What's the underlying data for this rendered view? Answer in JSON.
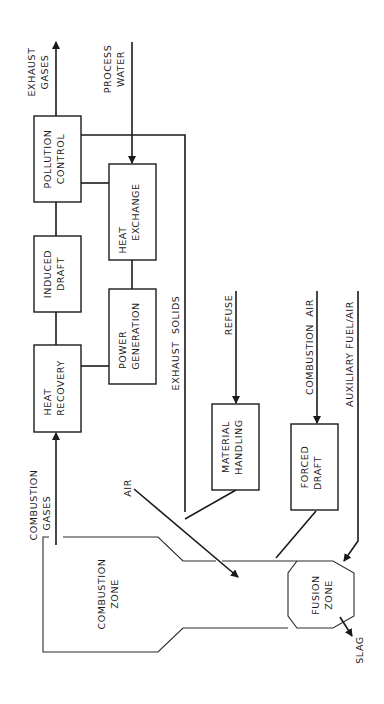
{
  "diagram": {
    "type": "process-flow",
    "orientation": "rotated-90-ccw",
    "nodes": [
      {
        "id": "pollution_control",
        "lines": [
          "POLLUTION",
          "CONTROL"
        ]
      },
      {
        "id": "heat_exchange",
        "lines": [
          "HEAT",
          "EXCHANGE"
        ]
      },
      {
        "id": "induced_draft",
        "lines": [
          "INDUCED",
          "DRAFT"
        ]
      },
      {
        "id": "power_generation",
        "lines": [
          "POWER",
          "GENERATION"
        ]
      },
      {
        "id": "heat_recovery",
        "lines": [
          "HEAT",
          "RECOVERY"
        ]
      },
      {
        "id": "material_handling",
        "lines": [
          "MATERIAL",
          "HANDLING"
        ]
      },
      {
        "id": "forced_draft",
        "lines": [
          "FORCED",
          "DRAFT"
        ]
      },
      {
        "id": "combustion_zone",
        "lines": [
          "COMBUSTION",
          "ZONE"
        ]
      },
      {
        "id": "fusion_zone",
        "lines": [
          "FUSION",
          "ZONE"
        ]
      }
    ],
    "labels": {
      "exhaust_gases": [
        "EXHAUST",
        "GASES"
      ],
      "process_water": [
        "PROCESS",
        "WATER"
      ],
      "exhaust_solids": "EXHAUST  SOLIDS",
      "refuse": "REFUSE",
      "combustion_air": "COMBUSTION  AIR",
      "auxiliary_fuel_air": "AUXILIARY FUEL/AIR",
      "combustion_gases": [
        "COMBUSTION",
        "GASES"
      ],
      "air": "AIR",
      "slag": "SLAG"
    },
    "edges": [
      {
        "from": "combustion_zone",
        "to": "heat_recovery",
        "label": "COMBUSTION GASES"
      },
      {
        "from": "heat_recovery",
        "to": "induced_draft"
      },
      {
        "from": "induced_draft",
        "to": "pollution_control"
      },
      {
        "from": "pollution_control",
        "to": "exhaust_gases",
        "label": "EXHAUST GASES"
      },
      {
        "from": "heat_recovery",
        "to": "power_generation"
      },
      {
        "from": "power_generation",
        "to": "heat_exchange"
      },
      {
        "from": "heat_exchange",
        "to": "pollution_control"
      },
      {
        "from": "process_water",
        "to": "heat_exchange",
        "label": "PROCESS WATER"
      },
      {
        "from": "pollution_control",
        "to": "combustion_zone",
        "label": "EXHAUST SOLIDS"
      },
      {
        "from": "refuse",
        "to": "material_handling",
        "label": "REFUSE"
      },
      {
        "from": "material_handling",
        "to": "combustion_zone"
      },
      {
        "from": "air",
        "to": "combustion_zone",
        "label": "AIR"
      },
      {
        "from": "combustion_air",
        "to": "forced_draft",
        "label": "COMBUSTION AIR"
      },
      {
        "from": "forced_draft",
        "to": "fusion_zone"
      },
      {
        "from": "auxiliary_fuel_air",
        "to": "fusion_zone",
        "label": "AUXILIARY FUEL/AIR"
      },
      {
        "from": "fusion_zone",
        "to": "slag",
        "label": "SLAG"
      }
    ]
  }
}
